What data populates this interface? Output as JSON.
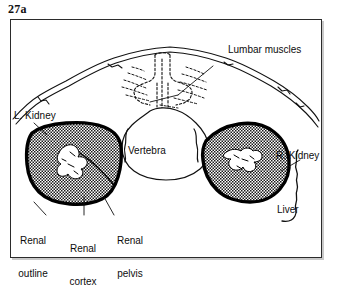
{
  "figure": {
    "number": "27a",
    "type": "anatomical-cross-section-diagram",
    "background_color": "#ffffff",
    "ink_color": "#000000",
    "frame_border_color": "#2b2b2b",
    "shadow_color": "#c9c9c9"
  },
  "labels": {
    "lumbar_muscles": "Lumbar muscles",
    "left_kidney": "L. Kidney",
    "right_kidney": "R. Kidney",
    "vertebra": "Vertebra",
    "liver": "Liver",
    "renal_outline_line1": "Renal",
    "renal_outline_line2": "outline",
    "renal_cortex_line1": "Renal",
    "renal_cortex_line2": "cortex",
    "renal_pelvis_line1": "Renal",
    "renal_pelvis_line2": "pelvis"
  },
  "structures": [
    {
      "name": "body-wall-outline",
      "style": "double thin curved line",
      "filled": false
    },
    {
      "name": "lumbar-muscles",
      "style": "dashed/stippled short strokes",
      "filled": false
    },
    {
      "name": "vertebra",
      "style": "dashed outline spinous process and solid vertebral body",
      "filled": false
    },
    {
      "name": "left-kidney",
      "style": "thick black outline with stipple fill",
      "filled": true
    },
    {
      "name": "right-kidney",
      "style": "thick black outline with stipple fill",
      "filled": true
    },
    {
      "name": "renal-pelvis",
      "style": "white unshaded region inside kidney",
      "filled": false
    },
    {
      "name": "liver",
      "style": "wavy single line margin",
      "filled": false
    }
  ]
}
